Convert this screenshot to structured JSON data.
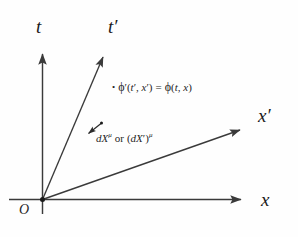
{
  "figure": {
    "background_color": "#fefefe",
    "stroke_color": "#3a3a3a",
    "text_color": "#1f1f1f"
  },
  "axes": {
    "t": {
      "label": "t",
      "kind": "vertical-unprimed-time"
    },
    "t_prime": {
      "label": "t′",
      "kind": "tilted-primed-time"
    },
    "x": {
      "label": "x",
      "kind": "horizontal-unprimed-space"
    },
    "x_prime": {
      "label": "x′",
      "kind": "tilted-primed-space"
    }
  },
  "origin": {
    "label": "O"
  },
  "annotations": {
    "scalar_field": {
      "bullet": "•",
      "lhs_phi": "ϕ",
      "lhs_prime": "′",
      "lhs_args_open": "(",
      "lhs_arg1": "t",
      "lhs_arg1_prime": "′",
      "lhs_comma": ", ",
      "lhs_arg2": "x",
      "lhs_arg2_prime": "′",
      "lhs_args_close": ")",
      "equals": "=",
      "rhs_phi": "ϕ",
      "rhs_args_open": "(",
      "rhs_arg1": "t",
      "rhs_comma": ", ",
      "rhs_arg2": "x",
      "rhs_args_close": ")",
      "full_text": "• ϕ′(t′, x′) = ϕ(t, x)"
    },
    "displacement_vector": {
      "term1_symbol": "dX",
      "term1_index": "μ",
      "conjunction": "or",
      "term2_open": "(",
      "term2_symbol": "dX",
      "term2_prime": "′",
      "term2_close": ")",
      "term2_index": "μ",
      "full_text": "dXμ or (dX′)μ"
    }
  }
}
